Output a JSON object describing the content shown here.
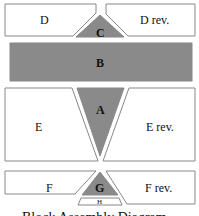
{
  "diagram": {
    "title": "Block Assembly Diagram",
    "colors": {
      "filled": "#8a8a8a",
      "outline": "#888888",
      "background": "#ffffff"
    },
    "blocks": {
      "D": "D",
      "D_rev": "D rev.",
      "C": "C",
      "B": "B",
      "A": "A",
      "E": "E",
      "E_rev": "E rev.",
      "F": "F",
      "F_rev": "F rev.",
      "G": "G",
      "H": "H"
    }
  }
}
